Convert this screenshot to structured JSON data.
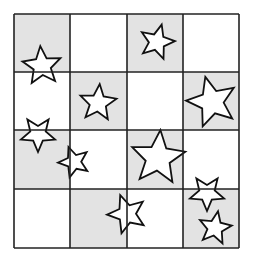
{
  "grid": {
    "rows": 4,
    "cols": 4,
    "x0": 14,
    "y0": 14,
    "col_lines": [
      14,
      70,
      127,
      183,
      239
    ],
    "row_lines": [
      14,
      72,
      130,
      189,
      248
    ],
    "shaded_color": "#e3e3e3",
    "blank_color": "#ffffff",
    "line_color": "#222222",
    "shaded": [
      [
        true,
        false,
        true,
        false
      ],
      [
        false,
        true,
        false,
        true
      ],
      [
        true,
        false,
        true,
        false
      ],
      [
        false,
        true,
        false,
        true
      ]
    ]
  },
  "stars": [
    {
      "cx": 42,
      "cy": 66,
      "r": 20,
      "rot": -5,
      "cell": "r1c1"
    },
    {
      "cx": 98,
      "cy": 103,
      "r": 19,
      "rot": 5,
      "cell": "r2c2"
    },
    {
      "cx": 157,
      "cy": 42,
      "r": 18,
      "rot": 15,
      "cell": "r1c3"
    },
    {
      "cx": 212,
      "cy": 102,
      "r": 26,
      "rot": -15,
      "cell": "r2c4"
    },
    {
      "cx": 38,
      "cy": 134,
      "r": 18,
      "rot": 180,
      "cell": "r3c1"
    },
    {
      "cx": 74,
      "cy": 162,
      "r": 16,
      "rot": -20,
      "cell": "r3c1"
    },
    {
      "cx": 158,
      "cy": 158,
      "r": 28,
      "rot": 5,
      "cell": "r3c3"
    },
    {
      "cx": 127,
      "cy": 214,
      "r": 20,
      "rot": -20,
      "cell": "r4c2"
    },
    {
      "cx": 207,
      "cy": 193,
      "r": 18,
      "rot": 180,
      "cell": "r4c4"
    },
    {
      "cx": 215,
      "cy": 228,
      "r": 17,
      "rot": 10,
      "cell": "r4c4"
    }
  ]
}
